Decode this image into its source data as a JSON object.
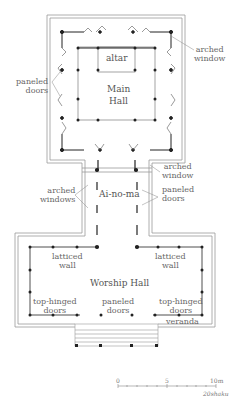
{
  "plan": {
    "rooms": {
      "altar": "altar",
      "main_hall_line1": "Main",
      "main_hall_line2": "Hall",
      "ai_no_ma": "Ai-no-ma",
      "worship_hall": "Worship Hall"
    },
    "labels": {
      "arched_window_top_1": "arched",
      "arched_window_top_2": "window",
      "paneled_doors_top_1": "paneled",
      "paneled_doors_top_2": "doors",
      "arched_window_mid_1": "arched",
      "arched_window_mid_2": "window",
      "arched_windows_left_1": "arched",
      "arched_windows_left_2": "windows",
      "paneled_doors_mid_1": "paneled",
      "paneled_doors_mid_2": "doors",
      "latticed_wall_left_1": "latticed",
      "latticed_wall_left_2": "wall",
      "latticed_wall_right_1": "latticed",
      "latticed_wall_right_2": "wall",
      "top_hinged_left_1": "top-hinged",
      "top_hinged_left_2": "doors",
      "paneled_doors_bottom_1": "paneled",
      "paneled_doors_bottom_2": "doors",
      "top_hinged_right_1": "top-hinged",
      "top_hinged_right_2": "doors",
      "veranda": "veranda"
    },
    "scale": {
      "tick_0": "0",
      "tick_5": "5",
      "tick_10": "10m",
      "shaku": "20shaku"
    },
    "colors": {
      "line": "#444444",
      "wall": "#888888",
      "label": "#666666"
    }
  }
}
